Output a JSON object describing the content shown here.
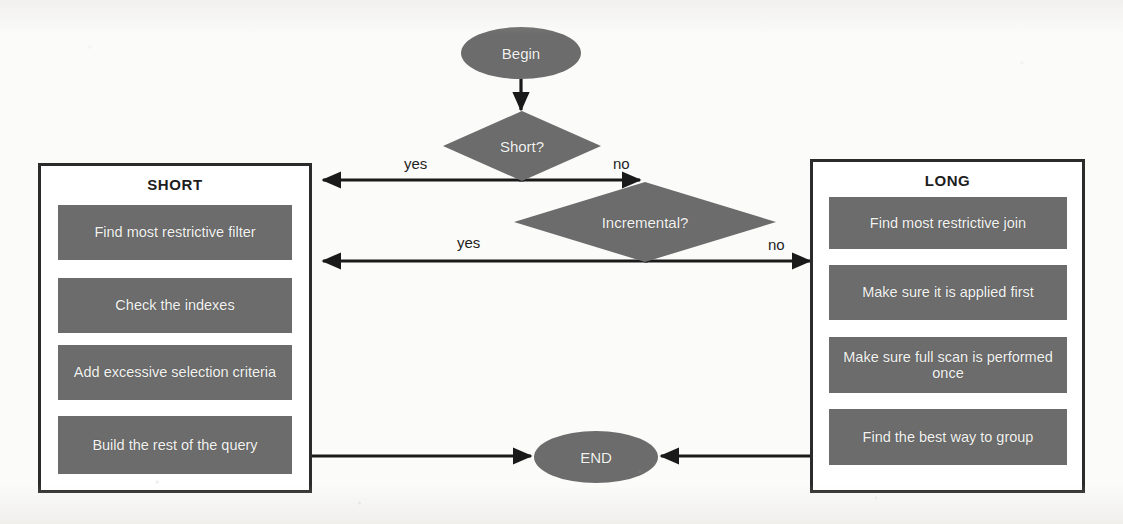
{
  "diagram": {
    "colors": {
      "shape_fill": "#6c6c6c",
      "shape_text": "#f3f3f1",
      "panel_border": "#2b2b2b",
      "connector": "#1a1a1a",
      "background": "#fbfbfa"
    },
    "start": {
      "label": "Begin"
    },
    "end": {
      "label": "END"
    },
    "decisions": [
      {
        "id": "short",
        "label": "Short?",
        "yes_label": "yes",
        "no_label": "no"
      },
      {
        "id": "incremental",
        "label": "Incremental?",
        "yes_label": "yes",
        "no_label": "no"
      }
    ],
    "panels": [
      {
        "id": "short-panel",
        "title": "SHORT",
        "steps": [
          "Find most restrictive filter",
          "Check the indexes",
          "Add excessive selection criteria",
          "Build the rest of the query"
        ]
      },
      {
        "id": "long-panel",
        "title": "LONG",
        "steps": [
          "Find most restrictive join",
          "Make sure it is applied first",
          "Make sure full scan is performed once",
          "Find the best way to group"
        ]
      }
    ],
    "edges": [
      {
        "from": "Begin",
        "to": "Short?",
        "label": ""
      },
      {
        "from": "Short?",
        "to": "SHORT",
        "label": "yes"
      },
      {
        "from": "Short?",
        "to": "Incremental?",
        "label": "no"
      },
      {
        "from": "Incremental?",
        "to": "SHORT",
        "label": "yes"
      },
      {
        "from": "Incremental?",
        "to": "LONG",
        "label": "no"
      },
      {
        "from": "SHORT",
        "to": "END",
        "label": ""
      },
      {
        "from": "LONG",
        "to": "END",
        "label": ""
      }
    ]
  }
}
